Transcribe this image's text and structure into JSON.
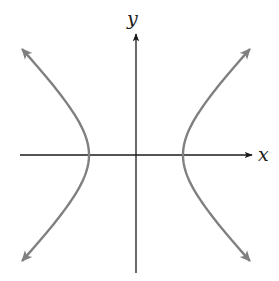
{
  "figure": {
    "type": "hyperbola",
    "labels": {
      "x_axis": "x",
      "y_axis": "y"
    },
    "colors": {
      "axis": "#1a1a1a",
      "curve": "#808080",
      "background": "#ffffff"
    }
  },
  "geometry": {
    "center": [
      136,
      155
    ],
    "a": 47,
    "b": 48,
    "x_axis_range": [
      20,
      252
    ],
    "y_axis_range": [
      34,
      273
    ],
    "branch_extent_y": 106
  }
}
